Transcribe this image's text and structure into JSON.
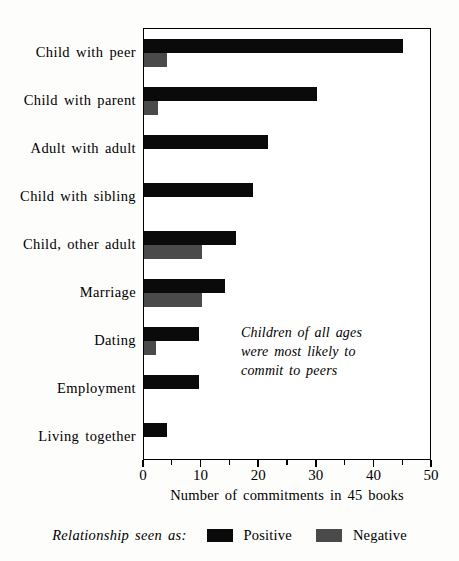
{
  "chart_data": {
    "type": "bar",
    "orientation": "horizontal",
    "title": "",
    "xlabel": "Number of commitments in 45 books",
    "ylabel": "",
    "xlim": [
      0,
      50
    ],
    "xticks": [
      0,
      10,
      20,
      30,
      40,
      50
    ],
    "xtick_labels": [
      "0",
      "10",
      "20",
      "30",
      "40",
      "50"
    ],
    "minor_xticks": [
      5,
      15,
      25,
      35,
      45
    ],
    "grid": false,
    "legend_position": "bottom",
    "categories": [
      "Child with peer",
      "Child with parent",
      "Adult with adult",
      "Child with sibling",
      "Child, other adult",
      "Marriage",
      "Dating",
      "Employment",
      "Living together"
    ],
    "series": [
      {
        "name": "Positive",
        "color": "#0a0a0a",
        "values": [
          45,
          30,
          21.5,
          19,
          16,
          14,
          9.5,
          9.5,
          4
        ]
      },
      {
        "name": "Negative",
        "color": "#4a4a4a",
        "values": [
          4,
          2.5,
          0,
          0,
          10,
          10,
          2,
          0,
          0
        ]
      }
    ],
    "annotations": [
      {
        "text": "Children of all ages were most likely to commit to peers",
        "lines": [
          "Children of all ages",
          "were most likely to",
          "commit to peers"
        ],
        "style": "italic"
      }
    ]
  },
  "legend": {
    "title": "Relationship seen as:",
    "entries": [
      {
        "label": "Positive",
        "color": "#0a0a0a"
      },
      {
        "label": "Negative",
        "color": "#4a4a4a"
      }
    ]
  }
}
